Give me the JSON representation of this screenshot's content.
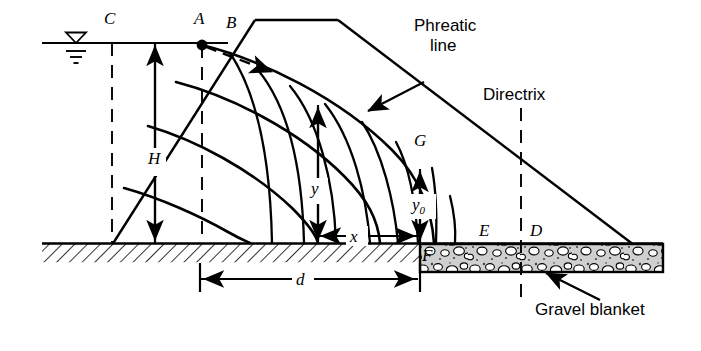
{
  "figure": {
    "type": "engineering-cross-section-diagram"
  },
  "point_labels": {
    "C": "C",
    "A": "A",
    "B": "B",
    "G": "G",
    "E": "E",
    "D": "D",
    "F": "F"
  },
  "dimension_labels": {
    "H": "H",
    "y": "y",
    "y0_text": "y",
    "y0_sub": "0",
    "x": "x",
    "d": "d"
  },
  "annotations": {
    "phreatic_line": "Phreatic\nline",
    "phreatic_line_l1": "Phreatic",
    "phreatic_line_l2": "line",
    "directrix": "Directrix",
    "gravel_blanket": "Gravel blanket"
  },
  "colors": {
    "line": "#000000",
    "fill": "#ffffff",
    "gravel_fill": "#cfcfcf",
    "gravel_stone": "#ffffff",
    "foundation_hatch": "#000000"
  }
}
